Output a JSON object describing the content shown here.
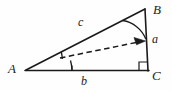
{
  "figure": {
    "kind": "right-triangle-vector-diagram",
    "canvas": {
      "width": 172,
      "height": 91
    },
    "background_color": "#fefefe",
    "stroke_color": "#1a1a1a",
    "label_color": "#1a1a1a",
    "vertices": [
      {
        "name": "A",
        "label": "A",
        "x": 26,
        "y": 70
      },
      {
        "name": "B",
        "label": "B",
        "x": 145,
        "y": 9
      },
      {
        "name": "C",
        "label": "C",
        "x": 148,
        "y": 70
      }
    ],
    "sides": [
      {
        "name": "hypotenuse-AB",
        "label": "c",
        "from": "A",
        "to": "B"
      },
      {
        "name": "opposite-BC",
        "label": "a",
        "from": "B",
        "to": "C"
      },
      {
        "name": "adjacent-AC",
        "label": "b",
        "from": "A",
        "to": "C"
      }
    ],
    "right_angle": {
      "at": "C",
      "size": 8
    },
    "angle_arc_B": {
      "at": "B",
      "radius": 30
    },
    "angle_arcs_A": {
      "at": "A",
      "radii": [
        36,
        46
      ]
    },
    "base_tick": {
      "x": 72,
      "y": 70,
      "height": 5
    },
    "vector": {
      "name": "dashed-vector",
      "style": "dashed-with-arrowhead",
      "from": {
        "x": 60,
        "y": 58
      },
      "to": {
        "x": 145,
        "y": 41
      }
    }
  }
}
